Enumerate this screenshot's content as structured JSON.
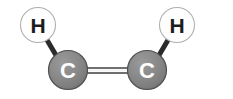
{
  "figure": {
    "kind": "molecular-structure-diagram",
    "title": "",
    "background_color": "#ffffff",
    "width": 233,
    "height": 99
  },
  "palette": {
    "background": "#ffffff",
    "hydrogen_fill": "#ffffff",
    "hydrogen_stroke": "#b3b3b3",
    "hydrogen_text": "#1c1c1c",
    "carbon_fill_light": "#8e8e8e",
    "carbon_fill_mid": "#7e7e7e",
    "carbon_fill_dark": "#6e6e6e",
    "carbon_stroke": "#4a4a4a",
    "carbon_text": "#ffffff",
    "single_bond_color": "#2b2b2b",
    "double_bond_color": "#8a8a8a",
    "double_bond_edge": "#5a5a5a"
  },
  "atoms": [
    {
      "id": "h-left",
      "element": "H",
      "label": "H",
      "name": "hydrogen-atom-left",
      "cx": 38,
      "cy": 25,
      "r": 17.5,
      "type": "hydrogen"
    },
    {
      "id": "c-left",
      "element": "C",
      "label": "C",
      "name": "carbon-atom-left",
      "cx": 68,
      "cy": 70,
      "r": 19.5,
      "type": "carbon"
    },
    {
      "id": "c-right",
      "element": "C",
      "label": "C",
      "name": "carbon-atom-right",
      "cx": 147,
      "cy": 70,
      "r": 19.5,
      "type": "carbon"
    },
    {
      "id": "h-right",
      "element": "H",
      "label": "H",
      "name": "hydrogen-atom-right",
      "cx": 177,
      "cy": 25,
      "r": 17.5,
      "type": "hydrogen"
    }
  ],
  "bonds": [
    {
      "id": "bond-h-left-c-left",
      "name": "bond-hydrogen-left-carbon-left",
      "from": "h-left",
      "to": "c-left",
      "order": 1,
      "order_label": "single",
      "x1": 47,
      "y1": 40,
      "x2": 60,
      "y2": 62,
      "width": 5
    },
    {
      "id": "bond-c-left-c-right",
      "name": "bond-carbon-left-carbon-right",
      "from": "c-left",
      "to": "c-right",
      "order": 2,
      "order_label": "double",
      "x1": 84,
      "x2": 131,
      "y_upper": 68,
      "y_lower": 73,
      "width": 2
    },
    {
      "id": "bond-h-right-c-right",
      "name": "bond-hydrogen-right-carbon-right",
      "from": "h-right",
      "to": "c-right",
      "order": 1,
      "order_label": "single",
      "x1": 168,
      "y1": 40,
      "x2": 155,
      "y2": 62,
      "width": 5
    }
  ],
  "formula": "C2H2"
}
